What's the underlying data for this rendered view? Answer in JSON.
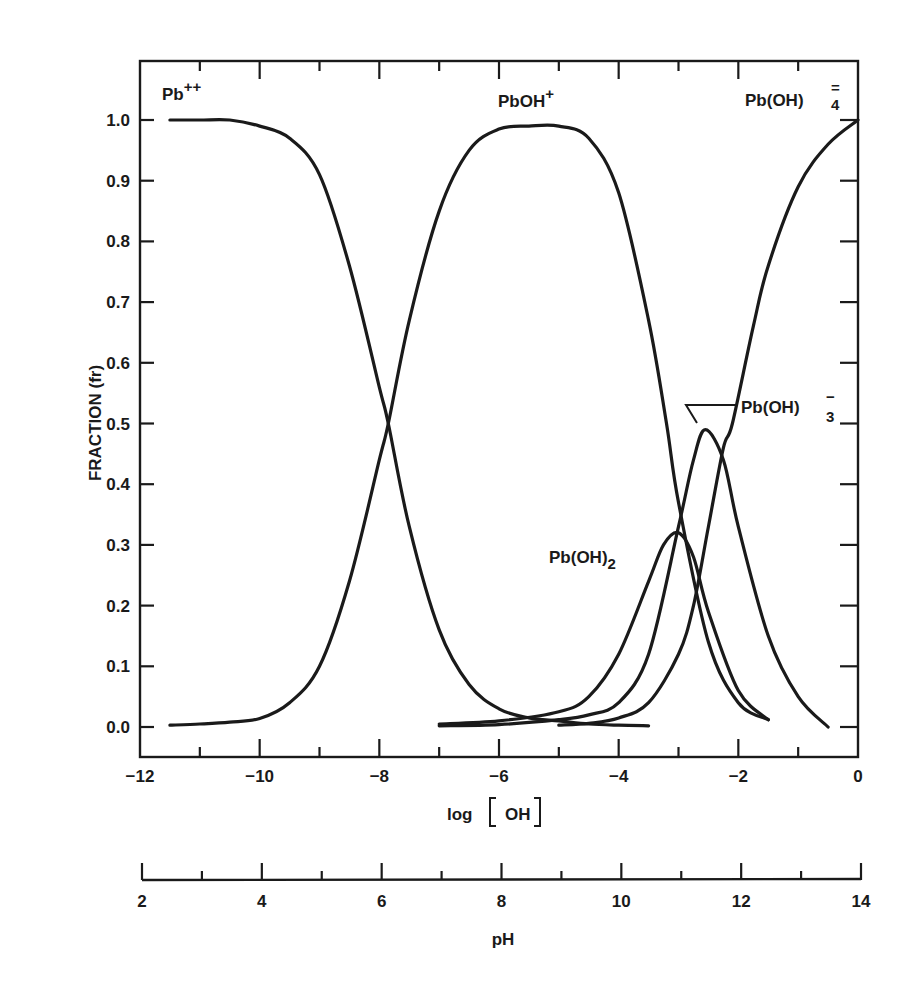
{
  "chart_data": {
    "type": "line",
    "title": "",
    "xlabel": "log [OH]",
    "ylabel": "FRACTION (fr)",
    "secondary_xlabel": "pH",
    "xlim": [
      -12,
      0
    ],
    "ylim": [
      -0.05,
      1.1
    ],
    "grid": false,
    "legend_position": "inline labels",
    "x_ticks": [
      -12,
      -10,
      -8,
      -6,
      -4,
      -2,
      0
    ],
    "x_tick_labels": [
      "−12",
      "−10",
      "−8",
      "−6",
      "−4",
      "−2",
      "0"
    ],
    "y_ticks": [
      0.0,
      0.1,
      0.2,
      0.3,
      0.4,
      0.5,
      0.6,
      0.7,
      0.8,
      0.9,
      1.0
    ],
    "y_tick_labels": [
      "0.0",
      "0.1",
      "0.2",
      "0.3",
      "0.4",
      "0.5",
      "0.6",
      "0.7",
      "0.8",
      "0.9",
      "1.0"
    ],
    "ph_ticks": [
      2,
      4,
      6,
      8,
      10,
      12,
      14
    ],
    "ph_tick_labels": [
      "2",
      "4",
      "6",
      "8",
      "10",
      "12",
      "14"
    ],
    "series": [
      {
        "name": "Pb++",
        "label_main": "Pb",
        "label_sup": "++",
        "label_sub": "",
        "x": [
          -11.5,
          -11.0,
          -10.5,
          -10.0,
          -9.5,
          -9.0,
          -8.5,
          -8.0,
          -7.85,
          -7.5,
          -7.0,
          -6.5,
          -6.0,
          -5.5,
          -5.0,
          -4.5,
          -4.0,
          -3.5
        ],
        "values": [
          1.0,
          1.0,
          1.0,
          0.99,
          0.97,
          0.91,
          0.76,
          0.56,
          0.5,
          0.33,
          0.16,
          0.07,
          0.03,
          0.015,
          0.01,
          0.005,
          0.003,
          0.002
        ]
      },
      {
        "name": "PbOH+",
        "label_main": "PbOH",
        "label_sup": "+",
        "label_sub": "",
        "x": [
          -11.5,
          -11.0,
          -10.5,
          -10.0,
          -9.5,
          -9.0,
          -8.5,
          -8.0,
          -7.85,
          -7.5,
          -7.0,
          -6.5,
          -6.0,
          -5.5,
          -5.0,
          -4.5,
          -4.0,
          -3.5,
          -3.2,
          -3.0,
          -2.5,
          -2.0,
          -1.5
        ],
        "values": [
          0.003,
          0.005,
          0.008,
          0.014,
          0.04,
          0.1,
          0.24,
          0.44,
          0.5,
          0.67,
          0.85,
          0.95,
          0.985,
          0.99,
          0.99,
          0.97,
          0.88,
          0.67,
          0.5,
          0.37,
          0.14,
          0.04,
          0.012
        ]
      },
      {
        "name": "Pb(OH)2",
        "label_main": "Pb(OH)",
        "label_sup": "",
        "label_sub": "2",
        "x": [
          -7.0,
          -6.0,
          -5.0,
          -4.5,
          -4.0,
          -3.5,
          -3.25,
          -3.0,
          -2.75,
          -2.5,
          -2.0,
          -1.5
        ],
        "values": [
          0.005,
          0.01,
          0.025,
          0.05,
          0.12,
          0.24,
          0.3,
          0.32,
          0.28,
          0.19,
          0.06,
          0.012
        ]
      },
      {
        "name": "Pb(OH)3-",
        "label_main": "Pb(OH)",
        "label_sup": "−",
        "label_sub": "3",
        "x": [
          -7.0,
          -6.0,
          -5.0,
          -4.5,
          -4.0,
          -3.5,
          -3.0,
          -2.75,
          -2.55,
          -2.25,
          -2.0,
          -1.5,
          -1.0,
          -0.5
        ],
        "values": [
          0.002,
          0.004,
          0.012,
          0.02,
          0.04,
          0.12,
          0.33,
          0.44,
          0.49,
          0.44,
          0.33,
          0.15,
          0.05,
          0.0
        ]
      },
      {
        "name": "Pb(OH)4=",
        "label_main": "Pb(OH)",
        "label_sup": "=",
        "label_sub": "4",
        "x": [
          -5.0,
          -4.5,
          -4.0,
          -3.5,
          -3.0,
          -2.75,
          -2.5,
          -2.25,
          -2.1,
          -1.75,
          -1.5,
          -1.0,
          -0.5,
          0.0
        ],
        "values": [
          0.003,
          0.006,
          0.015,
          0.04,
          0.12,
          0.2,
          0.33,
          0.46,
          0.5,
          0.66,
          0.76,
          0.89,
          0.96,
          1.0
        ]
      }
    ],
    "annotations": [
      {
        "text": "Pb++",
        "x": -11.2,
        "y": 1.06
      },
      {
        "text": "PbOH+",
        "x": -6.4,
        "y": 1.06
      },
      {
        "text": "Pb(OH)4=",
        "x": -1.6,
        "y": 1.06
      },
      {
        "text": "Pb(OH)3-",
        "x": -1.6,
        "y": 0.51,
        "leader_to": [
          -2.65,
          0.49
        ]
      },
      {
        "text": "Pb(OH)2",
        "x": -4.9,
        "y": 0.26
      }
    ],
    "intersections": [
      {
        "between": [
          "Pb++",
          "PbOH+"
        ],
        "x": -7.85,
        "y": 0.51
      }
    ]
  },
  "labels": {
    "y_title": "FRACTION (fr)",
    "x_title_prefix": "log",
    "x_title_inner": "OH",
    "ph_title": "pH",
    "pb2": {
      "main": "Pb",
      "sup": "++"
    },
    "pboh": {
      "main": "PbOH",
      "sup": "+"
    },
    "pboh4": {
      "main": "Pb(OH)",
      "sup": "=",
      "sub": "4"
    },
    "pboh3": {
      "main": "Pb(OH)",
      "sup": "−",
      "sub": "3"
    },
    "pboh2": {
      "main": "Pb(OH)",
      "sub": "2"
    }
  },
  "colors": {
    "ink": "#1a1a1a",
    "background": "#ffffff"
  }
}
